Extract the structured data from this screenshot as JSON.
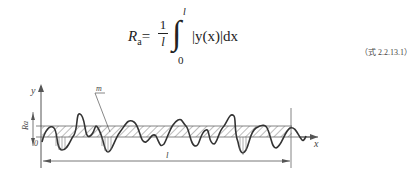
{
  "formula": {
    "lhs_symbol": "R",
    "lhs_subscript": "a",
    "equals": "=",
    "fraction_numerator": "1",
    "fraction_denominator": "l",
    "integral_sign": "∫",
    "integral_upper": "l",
    "integral_lower": "0",
    "integrand": "|y(x)|dx",
    "equation_number": "（式 2.2.13.1）"
  },
  "diagram": {
    "y_axis_label": "y",
    "x_axis_label": "x",
    "mean_line_label": "m",
    "ra_label": "Ra",
    "origin_label": "0",
    "length_label": "l"
  }
}
